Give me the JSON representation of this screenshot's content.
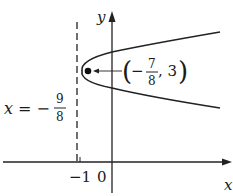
{
  "figure": {
    "type": "parabola-graph",
    "axes": {
      "x_label": "x",
      "y_label": "y",
      "origin_label": "0",
      "tick_labels": [
        "-1",
        "0"
      ]
    },
    "directrix": {
      "label_lhs": "x = −",
      "label_num": "9",
      "label_den": "8",
      "equation": "x = -9/8",
      "style": "dashed"
    },
    "focus": {
      "label_open": "(",
      "label_minus": "−",
      "label_num": "7",
      "label_den": "8",
      "label_rest": ", 3",
      "label_close": ")",
      "coordinates": "(-7/8, 3)"
    },
    "curve": {
      "description": "parabola opening to the right",
      "color": "#222222"
    },
    "colors": {
      "ink": "#222222",
      "background": "#ffffff"
    }
  }
}
